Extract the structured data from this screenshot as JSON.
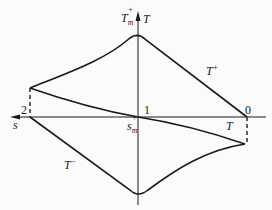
{
  "diagram": {
    "title": "",
    "axes": {
      "vertical": {
        "label": "T",
        "max_label_base": "T",
        "max_label_sub": "m",
        "max_label_sup": "+"
      },
      "horizontal": {
        "label": "s",
        "zero_label_base": "s",
        "zero_label_sub": "m",
        "zero_label_sup": "+"
      }
    },
    "points": {
      "p0": "0",
      "p1": "1",
      "p2": "2"
    },
    "curves": {
      "upper": {
        "base": "T",
        "sup": "+"
      },
      "lower": {
        "base": "T",
        "sup": "−"
      },
      "middle": {
        "base": "T"
      }
    },
    "colors": {
      "line": "#1a1a1a",
      "background": "#fbfbfb"
    }
  }
}
